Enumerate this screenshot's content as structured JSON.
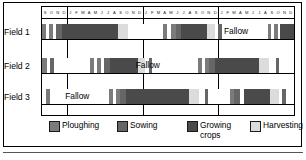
{
  "chart_data": {
    "type": "bar",
    "title": "",
    "xlabel": "",
    "ylabel": "",
    "orientation": "horizontal-timeline",
    "grid": true,
    "legend_position": "bottom",
    "axis": {
      "year_blocks": [
        {
          "months": [
            "S",
            "O",
            "N",
            "D"
          ]
        },
        {
          "months": [
            "J",
            "F",
            "M",
            "A",
            "M",
            "J",
            "J",
            "A",
            "S",
            "O",
            "N",
            "D"
          ]
        },
        {
          "months": [
            "J",
            "F",
            "M",
            "A",
            "M",
            "J",
            "J",
            "A",
            "S",
            "O",
            "N",
            "D"
          ]
        },
        {
          "months": [
            "J",
            "F",
            "M",
            "A",
            "M",
            "J",
            "J",
            "A",
            "S",
            "O",
            "N",
            "D"
          ]
        }
      ],
      "total_months": 40,
      "first_month": "S",
      "last_month": "D"
    },
    "categories": [
      "Field 1",
      "Field 2",
      "Field 3"
    ],
    "activity_colors": {
      "ploughing": "#7b7b7b",
      "sowing": "#666666",
      "growing_crops": "#4a4a4a",
      "harvesting": "#dcdcdc",
      "fallow": "#ffffff"
    },
    "series": [
      {
        "name": "Field 1",
        "label": "Field 1",
        "fallow_label": "Fallow",
        "fallow_label_center_pct": 77.0,
        "segments": [
          {
            "activity": "ploughing",
            "start_pct": 0.0,
            "end_pct": 1.6
          },
          {
            "activity": "fallow",
            "start_pct": 1.6,
            "end_pct": 2.6
          },
          {
            "activity": "ploughing",
            "start_pct": 2.6,
            "end_pct": 4.4
          },
          {
            "activity": "fallow",
            "start_pct": 4.4,
            "end_pct": 5.4
          },
          {
            "activity": "sowing",
            "start_pct": 5.4,
            "end_pct": 8.0
          },
          {
            "activity": "growing_crops",
            "start_pct": 8.0,
            "end_pct": 30.0
          },
          {
            "activity": "harvesting",
            "start_pct": 30.0,
            "end_pct": 34.2
          },
          {
            "activity": "fallow",
            "start_pct": 34.2,
            "end_pct": 48.0
          },
          {
            "activity": "ploughing",
            "start_pct": 48.0,
            "end_pct": 49.8
          },
          {
            "activity": "fallow",
            "start_pct": 49.8,
            "end_pct": 51.0
          },
          {
            "activity": "ploughing",
            "start_pct": 51.0,
            "end_pct": 53.0
          },
          {
            "activity": "sowing",
            "start_pct": 53.0,
            "end_pct": 55.0
          },
          {
            "activity": "growing_crops",
            "start_pct": 55.0,
            "end_pct": 65.5
          },
          {
            "activity": "harvesting",
            "start_pct": 65.5,
            "end_pct": 68.5
          },
          {
            "activity": "fallow",
            "start_pct": 68.5,
            "end_pct": 70.0
          },
          {
            "activity": "sowing",
            "start_pct": 70.0,
            "end_pct": 71.4
          },
          {
            "activity": "fallow",
            "start_pct": 71.4,
            "end_pct": 89.5
          },
          {
            "activity": "ploughing",
            "start_pct": 89.5,
            "end_pct": 91.0
          },
          {
            "activity": "fallow",
            "start_pct": 91.0,
            "end_pct": 92.0
          },
          {
            "activity": "ploughing",
            "start_pct": 92.0,
            "end_pct": 93.6
          },
          {
            "activity": "fallow",
            "start_pct": 93.6,
            "end_pct": 94.6
          },
          {
            "activity": "growing_crops",
            "start_pct": 94.6,
            "end_pct": 100.0
          }
        ]
      },
      {
        "name": "Field 2",
        "label": "Field 2",
        "fallow_label": "Fallow",
        "fallow_label_center_pct": 42.0,
        "segments": [
          {
            "activity": "ploughing",
            "start_pct": 0.0,
            "end_pct": 1.8
          },
          {
            "activity": "fallow",
            "start_pct": 1.8,
            "end_pct": 3.2
          },
          {
            "activity": "sowing",
            "start_pct": 3.2,
            "end_pct": 4.6
          },
          {
            "activity": "fallow",
            "start_pct": 4.6,
            "end_pct": 19.0
          },
          {
            "activity": "ploughing",
            "start_pct": 19.0,
            "end_pct": 20.8
          },
          {
            "activity": "fallow",
            "start_pct": 20.8,
            "end_pct": 21.8
          },
          {
            "activity": "ploughing",
            "start_pct": 21.8,
            "end_pct": 23.6
          },
          {
            "activity": "fallow",
            "start_pct": 23.6,
            "end_pct": 24.6
          },
          {
            "activity": "sowing",
            "start_pct": 24.6,
            "end_pct": 27.0
          },
          {
            "activity": "growing_crops",
            "start_pct": 27.0,
            "end_pct": 38.0
          },
          {
            "activity": "harvesting",
            "start_pct": 38.0,
            "end_pct": 41.0
          },
          {
            "activity": "fallow",
            "start_pct": 41.0,
            "end_pct": 42.4
          },
          {
            "activity": "sowing",
            "start_pct": 42.4,
            "end_pct": 43.8
          },
          {
            "activity": "fallow",
            "start_pct": 43.8,
            "end_pct": 62.0
          },
          {
            "activity": "ploughing",
            "start_pct": 62.0,
            "end_pct": 63.6
          },
          {
            "activity": "fallow",
            "start_pct": 63.6,
            "end_pct": 64.6
          },
          {
            "activity": "ploughing",
            "start_pct": 64.6,
            "end_pct": 66.2
          },
          {
            "activity": "sowing",
            "start_pct": 66.2,
            "end_pct": 68.6
          },
          {
            "activity": "growing_crops",
            "start_pct": 68.6,
            "end_pct": 86.0
          },
          {
            "activity": "harvesting",
            "start_pct": 86.0,
            "end_pct": 90.0
          },
          {
            "activity": "fallow",
            "start_pct": 90.0,
            "end_pct": 92.8
          },
          {
            "activity": "sowing",
            "start_pct": 92.8,
            "end_pct": 94.2
          },
          {
            "activity": "fallow",
            "start_pct": 94.2,
            "end_pct": 100.0
          }
        ]
      },
      {
        "name": "Field 3",
        "label": "Field 3",
        "fallow_label": "Fallow",
        "fallow_label_center_pct": 14.0,
        "segments": [
          {
            "activity": "fallow",
            "start_pct": 0.0,
            "end_pct": 1.4
          },
          {
            "activity": "ploughing",
            "start_pct": 1.4,
            "end_pct": 3.0
          },
          {
            "activity": "fallow",
            "start_pct": 3.0,
            "end_pct": 26.5
          },
          {
            "activity": "ploughing",
            "start_pct": 26.5,
            "end_pct": 28.2
          },
          {
            "activity": "fallow",
            "start_pct": 28.2,
            "end_pct": 29.2
          },
          {
            "activity": "ploughing",
            "start_pct": 29.2,
            "end_pct": 30.8
          },
          {
            "activity": "sowing",
            "start_pct": 30.8,
            "end_pct": 33.4
          },
          {
            "activity": "growing_crops",
            "start_pct": 33.4,
            "end_pct": 58.5
          },
          {
            "activity": "harvesting",
            "start_pct": 58.5,
            "end_pct": 62.5
          },
          {
            "activity": "fallow",
            "start_pct": 62.5,
            "end_pct": 64.5
          },
          {
            "activity": "sowing",
            "start_pct": 64.5,
            "end_pct": 66.0
          },
          {
            "activity": "fallow",
            "start_pct": 66.0,
            "end_pct": 74.5
          },
          {
            "activity": "ploughing",
            "start_pct": 74.5,
            "end_pct": 76.2
          },
          {
            "activity": "sowing",
            "start_pct": 76.2,
            "end_pct": 78.6
          },
          {
            "activity": "fallow",
            "start_pct": 78.6,
            "end_pct": 80.0
          },
          {
            "activity": "growing_crops",
            "start_pct": 80.0,
            "end_pct": 90.5
          },
          {
            "activity": "harvesting",
            "start_pct": 90.5,
            "end_pct": 94.0
          },
          {
            "activity": "fallow",
            "start_pct": 94.0,
            "end_pct": 95.4
          },
          {
            "activity": "sowing",
            "start_pct": 95.4,
            "end_pct": 96.8
          },
          {
            "activity": "fallow",
            "start_pct": 96.8,
            "end_pct": 100.0
          }
        ]
      }
    ],
    "legend": [
      {
        "key": "ploughing",
        "label": "Ploughing",
        "color": "#7b7b7b"
      },
      {
        "key": "sowing",
        "label": "Sowing",
        "color": "#666666"
      },
      {
        "key": "growing_crops",
        "label": "Growing\ncrops",
        "color": "#4a4a4a"
      },
      {
        "key": "harvesting",
        "label": "Harvesting",
        "color": "#dcdcdc"
      }
    ]
  }
}
